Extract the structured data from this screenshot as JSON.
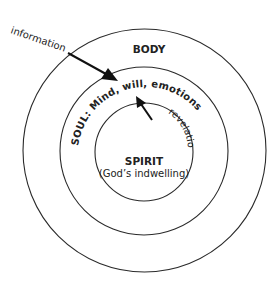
{
  "diagram": {
    "rings": [
      {
        "id": "body",
        "label": "BODY"
      },
      {
        "id": "soul",
        "label": "SOUL: Mind, will, emotions"
      },
      {
        "id": "spirit",
        "label": "SPIRIT",
        "sublabel": "(God’s indwelling)"
      }
    ],
    "arrows": [
      {
        "id": "information",
        "label": "information",
        "from": "outside",
        "to": "soul"
      },
      {
        "id": "revelation",
        "label": "revelation",
        "from": "spirit",
        "to": "soul"
      }
    ],
    "colors": {
      "stroke": "#2a2a2a",
      "text": "#222222",
      "background": "#ffffff"
    }
  }
}
